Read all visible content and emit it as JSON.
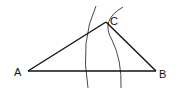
{
  "diagram": {
    "title": "",
    "points": [
      {
        "id": "A",
        "label": "A",
        "x": 28,
        "y": 71
      },
      {
        "id": "B",
        "label": "B",
        "x": 156,
        "y": 71
      },
      {
        "id": "C",
        "label": "C",
        "x": 106,
        "y": 22
      }
    ],
    "segments": [
      {
        "from": "A",
        "to": "B"
      },
      {
        "from": "A",
        "to": "C"
      },
      {
        "from": "C",
        "to": "B"
      }
    ],
    "arcs": [
      {
        "name": "arc-from-B",
        "description": "Arc centered near B, passing through C"
      },
      {
        "name": "arc-from-A",
        "description": "Arc centered near A, passing through C"
      }
    ],
    "colors": {
      "line": "#111111",
      "arc": "#333333",
      "background": "#ffffff"
    }
  }
}
